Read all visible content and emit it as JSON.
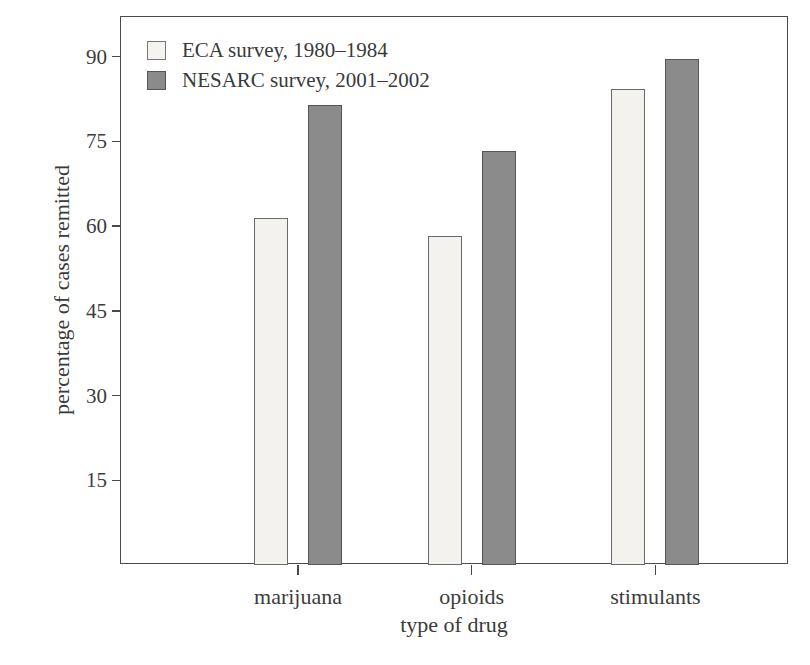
{
  "chart_data": {
    "type": "bar",
    "title": "",
    "subtitle": "",
    "xlabel": "type of drug",
    "ylabel": "percentage of cases remitted",
    "categories": [
      "marijuana",
      "opioids",
      "stimulants"
    ],
    "series": [
      {
        "name": "ECA survey, 1980–1984",
        "color": "#f3f2ef",
        "values": [
          61.5,
          58.3,
          84.2
        ]
      },
      {
        "name": "NESARC survey, 2001–2002",
        "color": "#8b8b8b",
        "values": [
          81.5,
          73.2,
          89.5
        ]
      }
    ],
    "ylim": [
      0,
      97
    ],
    "yticks": [
      15,
      30,
      45,
      60,
      75,
      90
    ],
    "ytick_labels": [
      "15",
      "30",
      "45",
      "60",
      "75",
      "90"
    ],
    "xtick_labels": [
      "marijuana",
      "opioids",
      "stimulants"
    ],
    "grid": false,
    "legend_position": "top-left",
    "frame": "box"
  },
  "legend": {
    "items": [
      {
        "label": "ECA survey, 1980–1984",
        "swatch": "light-square-swatch"
      },
      {
        "label": "NESARC survey, 2001–2002",
        "swatch": "dark-square-swatch"
      }
    ]
  },
  "axes": {
    "y_title": "percentage of cases remitted",
    "x_title": "type of drug"
  }
}
